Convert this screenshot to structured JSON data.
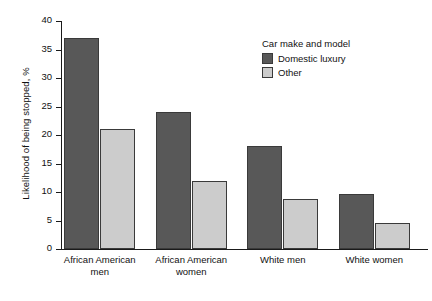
{
  "chart_data": {
    "type": "bar",
    "title": "",
    "xlabel": "",
    "ylabel": "Likelihood of being stopped, %",
    "ylim": [
      0,
      40
    ],
    "ytick_values": [
      40,
      35,
      30,
      25,
      20,
      15,
      10,
      5,
      0
    ],
    "ytick_labels": [
      "40",
      "35",
      "30",
      "25",
      "20",
      "15",
      "10",
      "5",
      "0"
    ],
    "grid": false,
    "legend_position": "upper right",
    "legend_title": "Car make and model",
    "categories": [
      "African American men",
      "African American women",
      "White men",
      "White women"
    ],
    "category_lines": [
      [
        "African American",
        "men"
      ],
      [
        "African American",
        "women"
      ],
      [
        "White men",
        ""
      ],
      [
        "White women",
        ""
      ]
    ],
    "series": [
      {
        "name": "Domestic luxury",
        "color": "#585858",
        "values": [
          37,
          24,
          18,
          9.7
        ]
      },
      {
        "name": "Other",
        "color": "#cccccc",
        "values": [
          21,
          12,
          8.7,
          4.6
        ]
      }
    ]
  }
}
